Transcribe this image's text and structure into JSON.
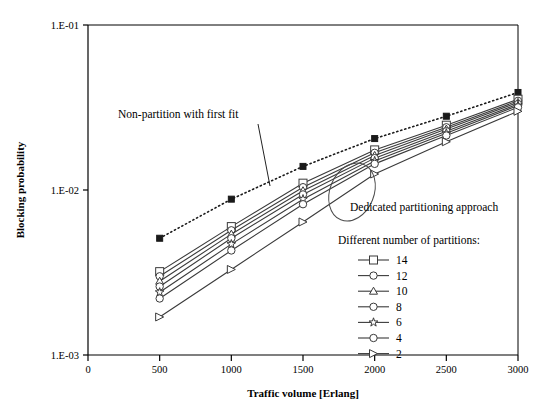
{
  "chart_data": {
    "type": "line",
    "title": "",
    "xlabel": "Traffic volume [Erlang]",
    "ylabel": "Blocking probability",
    "xlim": [
      0,
      3000
    ],
    "ylim": [
      0.001,
      0.1
    ],
    "yscale": "log",
    "grid": false,
    "legend_position": "inside-right",
    "legend_title": "Different number of partitions:",
    "x_ticks": [
      "0",
      "500",
      "1000",
      "1500",
      "2000",
      "2500",
      "3000"
    ],
    "x_tick_values": [
      0,
      500,
      1000,
      1500,
      2000,
      2500,
      3000
    ],
    "y_ticks": [
      "1.E-01",
      "1.E-02",
      "1.E-03"
    ],
    "y_tick_values": [
      0.1,
      0.01,
      0.001
    ],
    "x": [
      500,
      1000,
      1500,
      2000,
      2500,
      3000
    ],
    "series": [
      {
        "name": "Non-partition with first fit",
        "marker": "filled-square",
        "line": "dotted",
        "values": [
          0.0051,
          0.0088,
          0.0139,
          0.0205,
          0.028,
          0.039
        ]
      },
      {
        "name": "14",
        "marker": "square",
        "line": "solid",
        "values": [
          0.0032,
          0.006,
          0.011,
          0.0175,
          0.0247,
          0.0355
        ]
      },
      {
        "name": "12",
        "marker": "circle",
        "line": "solid",
        "values": [
          0.003,
          0.0057,
          0.0104,
          0.0168,
          0.024,
          0.0347
        ]
      },
      {
        "name": "10",
        "marker": "triangle",
        "line": "solid",
        "values": [
          0.0028,
          0.0054,
          0.0099,
          0.0162,
          0.0234,
          0.034
        ]
      },
      {
        "name": "8",
        "marker": "circle",
        "line": "solid",
        "values": [
          0.0026,
          0.0051,
          0.0094,
          0.0156,
          0.0227,
          0.0332
        ]
      },
      {
        "name": "6",
        "marker": "star",
        "line": "solid",
        "values": [
          0.0024,
          0.0047,
          0.0088,
          0.015,
          0.0221,
          0.0325
        ]
      },
      {
        "name": "4",
        "marker": "circle",
        "line": "solid",
        "values": [
          0.0022,
          0.0043,
          0.0082,
          0.0144,
          0.0214,
          0.0317
        ]
      },
      {
        "name": "2",
        "marker": "right-triangle",
        "line": "solid",
        "values": [
          0.0017,
          0.0033,
          0.0064,
          0.0125,
          0.0196,
          0.03
        ]
      }
    ],
    "annotations": [
      {
        "text": "Non-partition with first fit",
        "x_px": 118,
        "y_px": 118,
        "leader": true
      },
      {
        "text": "Dedicated partitioning approach",
        "x_px": 350,
        "y_px": 211,
        "leader": false
      }
    ],
    "legend_entries": [
      {
        "label": "14",
        "marker": "square"
      },
      {
        "label": "12",
        "marker": "circle"
      },
      {
        "label": "10",
        "marker": "triangle"
      },
      {
        "label": "8",
        "marker": "circle"
      },
      {
        "label": "6",
        "marker": "star"
      },
      {
        "label": "4",
        "marker": "circle"
      },
      {
        "label": "2",
        "marker": "right-triangle"
      }
    ],
    "colors": {
      "line": "#3a3a3a",
      "marker_fill": "#ffffff",
      "axis": "#000000",
      "background": "#ffffff"
    }
  }
}
